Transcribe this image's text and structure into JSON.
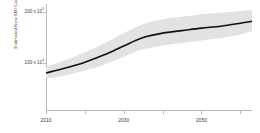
{
  "chart_data": {
    "type": "line",
    "title": "",
    "xlabel": "",
    "ylabel": "Estimated New SMI Cases/year",
    "xlim": [
      2010,
      2063
    ],
    "ylim": [
      0,
      215000
    ],
    "grid": false,
    "legend": false,
    "y_ticks": [
      {
        "value": 100000,
        "label": "100 x 10",
        "exponent": "3"
      },
      {
        "value": 200000,
        "label": "200 x 10",
        "exponent": "3"
      }
    ],
    "x_ticks": [
      2010,
      2020,
      2030,
      2040,
      2050,
      2060
    ],
    "x_tick_labels": [
      {
        "value": 2010,
        "label": "2010"
      },
      {
        "value": 2030,
        "label": "2030"
      },
      {
        "value": 2050,
        "label": "2050"
      }
    ],
    "series": [
      {
        "name": "Estimated new SMI cases per year",
        "kind": "line",
        "color": "#111111",
        "x": [
          2010,
          2015,
          2020,
          2025,
          2030,
          2035,
          2040,
          2045,
          2050,
          2055,
          2060,
          2063
        ],
        "values": [
          75000,
          85000,
          97000,
          112000,
          130000,
          147000,
          156000,
          161000,
          166000,
          170000,
          176000,
          180000
        ]
      },
      {
        "name": "Uncertainty interval",
        "kind": "ribbon",
        "color": "#e2e2e2",
        "x": [
          2010,
          2015,
          2020,
          2025,
          2030,
          2035,
          2040,
          2045,
          2050,
          2055,
          2060,
          2063
        ],
        "lower": [
          63000,
          70000,
          80000,
          92000,
          108000,
          123000,
          131000,
          136000,
          141000,
          146000,
          153000,
          160000
        ],
        "upper": [
          88000,
          101000,
          117000,
          135000,
          156000,
          174000,
          184000,
          189000,
          194000,
          197000,
          201000,
          203000
        ]
      }
    ]
  },
  "axes": {
    "y_title": "Estimated New SMI Cases/year"
  }
}
